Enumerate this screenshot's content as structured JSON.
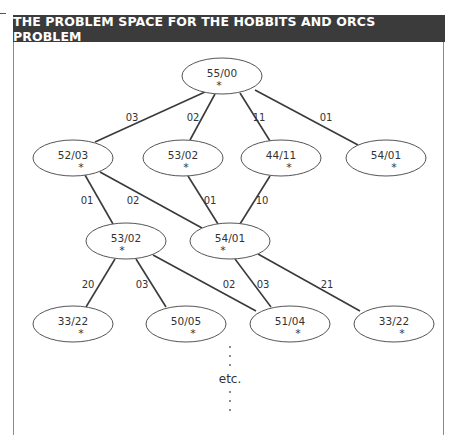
{
  "header": {
    "title": "THE PROBLEM SPACE FOR THE HOBBITS AND ORCS PROBLEM"
  },
  "diagram": {
    "nodes": [
      {
        "id": "root",
        "label": "55/00",
        "cx": 222,
        "cy": 76,
        "star_dx": -3
      },
      {
        "id": "n1a",
        "label": "52/03",
        "cx": 73,
        "cy": 158,
        "star_dx": 8
      },
      {
        "id": "n1b",
        "label": "53/02",
        "cx": 183,
        "cy": 158,
        "star_dx": 3
      },
      {
        "id": "n1c",
        "label": "44/11",
        "cx": 281,
        "cy": 158,
        "star_dx": 8
      },
      {
        "id": "n1d",
        "label": "54/01",
        "cx": 386,
        "cy": 158,
        "star_dx": 8
      },
      {
        "id": "n2a",
        "label": "53/02",
        "cx": 126,
        "cy": 241,
        "star_dx": -4
      },
      {
        "id": "n2b",
        "label": "54/01",
        "cx": 230,
        "cy": 241,
        "star_dx": -7
      },
      {
        "id": "n3a",
        "label": "33/22",
        "cx": 73,
        "cy": 324,
        "star_dx": 8
      },
      {
        "id": "n3b",
        "label": "50/05",
        "cx": 186,
        "cy": 324,
        "star_dx": 7
      },
      {
        "id": "n3c",
        "label": "51/04",
        "cx": 290,
        "cy": 324,
        "star_dx": 8
      },
      {
        "id": "n3d",
        "label": "33/22",
        "cx": 394,
        "cy": 324,
        "star_dx": 8
      }
    ],
    "edges": [
      {
        "x1": 205,
        "y1": 92,
        "x2": 95,
        "y2": 142,
        "label": "03",
        "lx": 132,
        "ly": 121
      },
      {
        "x1": 215,
        "y1": 94,
        "x2": 190,
        "y2": 140,
        "label": "02",
        "lx": 193,
        "ly": 121
      },
      {
        "x1": 240,
        "y1": 93,
        "x2": 270,
        "y2": 141,
        "label": "11",
        "lx": 259,
        "ly": 121
      },
      {
        "x1": 255,
        "y1": 90,
        "x2": 358,
        "y2": 145,
        "label": "01",
        "lx": 326,
        "ly": 121
      },
      {
        "x1": 85,
        "y1": 175,
        "x2": 113,
        "y2": 224,
        "label": "01",
        "lx": 87,
        "ly": 204
      },
      {
        "x1": 100,
        "y1": 172,
        "x2": 202,
        "y2": 228,
        "label": "02",
        "lx": 133,
        "ly": 204
      },
      {
        "x1": 188,
        "y1": 176,
        "x2": 218,
        "y2": 224,
        "label": "01",
        "lx": 210,
        "ly": 204
      },
      {
        "x1": 270,
        "y1": 176,
        "x2": 240,
        "y2": 224,
        "label": "10",
        "lx": 262,
        "ly": 204
      },
      {
        "x1": 115,
        "y1": 259,
        "x2": 86,
        "y2": 307,
        "label": "20",
        "lx": 88,
        "ly": 288
      },
      {
        "x1": 136,
        "y1": 259,
        "x2": 166,
        "y2": 307,
        "label": "03",
        "lx": 142,
        "ly": 288
      },
      {
        "x1": 153,
        "y1": 255,
        "x2": 256,
        "y2": 311,
        "label": "02",
        "lx": 229,
        "ly": 288
      },
      {
        "x1": 235,
        "y1": 259,
        "x2": 271,
        "y2": 307,
        "label": "03",
        "lx": 263,
        "ly": 288
      },
      {
        "x1": 258,
        "y1": 254,
        "x2": 360,
        "y2": 311,
        "label": "21",
        "lx": 327,
        "ly": 288
      }
    ],
    "continuation": {
      "text": "etc.",
      "x": 230,
      "y": 383
    }
  }
}
